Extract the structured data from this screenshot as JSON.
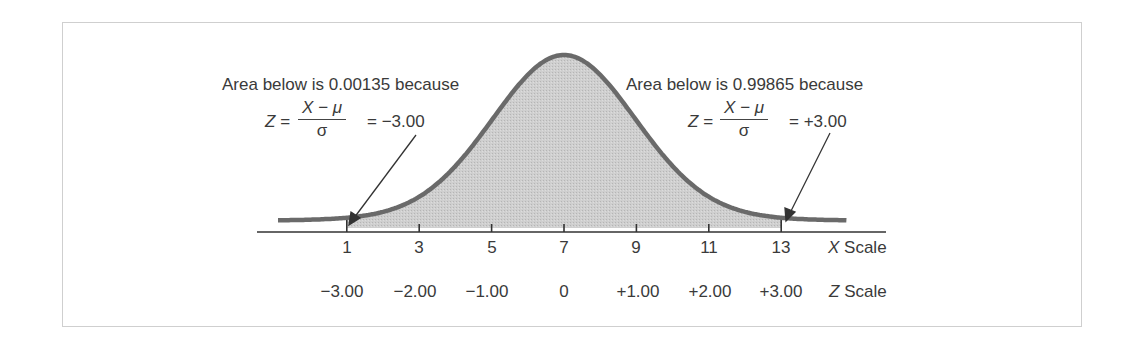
{
  "diagram": {
    "type": "normal-distribution",
    "mean_x": 7,
    "sd_x": 2,
    "curve_color": "#6a6a6a",
    "fill_color": "#cbcbcb",
    "left_annotation": {
      "text": "Area below is 0.00135 because",
      "z_lhs": "Z =",
      "numerator": "X − μ",
      "denominator": "σ",
      "z_rhs": "= −3.00",
      "points_to_x": 1
    },
    "right_annotation": {
      "text": "Area below is 0.99865 because",
      "z_lhs": "Z =",
      "numerator": "X − μ",
      "denominator": "σ",
      "z_rhs": "= +3.00",
      "points_to_x": 13
    },
    "x_scale": {
      "label_var": "X",
      "label_word": "Scale",
      "ticks": [
        "1",
        "3",
        "5",
        "7",
        "9",
        "11",
        "13"
      ]
    },
    "z_scale": {
      "label_var": "Z",
      "label_word": "Scale",
      "ticks": [
        "−3.00",
        "−2.00",
        "−1.00",
        "0",
        "+1.00",
        "+2.00",
        "+3.00"
      ]
    }
  }
}
